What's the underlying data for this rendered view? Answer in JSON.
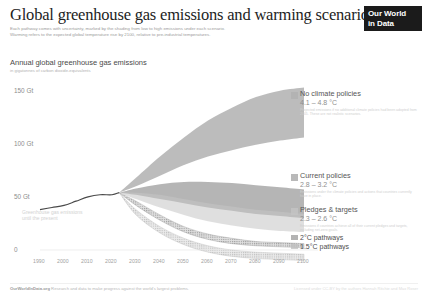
{
  "header": {
    "title": "Global greenhouse gas emissions and warming scenarios",
    "subtitle_line1": "Each pathway comes with uncertainty, marked by the shading from low to high emissions under each scenario.",
    "subtitle_line2": "Warming refers to the expected global temperature rise by 2100, relative to pre-industrial temperatures.",
    "logo_line1": "Our World",
    "logo_line2": "in Data"
  },
  "chart_heading": {
    "heading": "Annual global greenhouse gas emissions",
    "sub": "in gigatonnes of carbon dioxide-equivalents"
  },
  "historical_label": {
    "line1": "Greenhouse gas emissions",
    "line2": "until the present"
  },
  "annotations": [
    {
      "name": "No climate policies",
      "temp": "4.1 – 4.8 °C",
      "note": "Projected emissions if no additional climate policies had been adopted from 2005. These are not realistic scenarios.",
      "color": "#b0b0b0",
      "top": 90,
      "swatch_top": 92
    },
    {
      "name": "Current policies",
      "temp": "2.8 – 3.2 °C",
      "note": "Emissions under the climate policies and actions that countries currently have in place.",
      "color": "#a8a8a8",
      "top": 172,
      "swatch_top": 174
    },
    {
      "name": "Pledges & targets",
      "temp": "2.3 – 2.6 °C",
      "note": "Emissions if countries achieve all of their current pledges and targets, including net-zero goals.",
      "color": "#c4c4c4",
      "top": 206,
      "swatch_top": 208
    }
  ],
  "pathway_legend": [
    {
      "label": "2°C pathways",
      "color": "#9a9a9a"
    },
    {
      "label": "1.5°C pathways",
      "color": "#bdbdbd"
    }
  ],
  "footer": {
    "brand": "OurWorldInData.org",
    "source": "Research and data to make progress against the world's largest problems.",
    "license": "Licensed under CC-BY by the authors Hannah Ritchie and Max Roser"
  },
  "chart_data": {
    "type": "area",
    "title": "Annual global greenhouse gas emissions",
    "xlabel": "",
    "ylabel": "Gigatonnes of CO2-equivalents",
    "xlim": [
      1990,
      2100
    ],
    "ylim": [
      0,
      160
    ],
    "grid": false,
    "legend_position": "right",
    "y_ticks": [
      "0",
      "50 Gt",
      "100 Gt",
      "150 Gt"
    ],
    "y_tick_values": [
      0,
      50,
      100,
      150
    ],
    "x_ticks": [
      "1990",
      "2000",
      "2010",
      "2020",
      "2030",
      "2040",
      "2050",
      "2060",
      "2070",
      "2080",
      "2090",
      "2100"
    ],
    "x_tick_values": [
      1990,
      2000,
      2010,
      2020,
      2030,
      2040,
      2050,
      2060,
      2070,
      2080,
      2090,
      2100
    ],
    "historical": {
      "name": "Historical emissions",
      "x": [
        1990,
        1995,
        2000,
        2005,
        2010,
        2015,
        2020,
        2023
      ],
      "y": [
        38,
        40,
        42,
        46,
        50,
        52,
        52,
        54
      ]
    },
    "series": [
      {
        "name": "No climate policies",
        "temperature_range": "4.1 – 4.8 °C",
        "color": "#b0b0b0",
        "x": [
          2023,
          2030,
          2040,
          2050,
          2060,
          2070,
          2080,
          2090,
          2100
        ],
        "lower": [
          54,
          60,
          70,
          80,
          88,
          94,
          99,
          103,
          106
        ],
        "upper": [
          54,
          68,
          88,
          106,
          122,
          134,
          144,
          150,
          153
        ]
      },
      {
        "name": "Current policies",
        "temperature_range": "2.8 – 3.2 °C",
        "color": "#a8a8a8",
        "x": [
          2023,
          2030,
          2040,
          2050,
          2060,
          2070,
          2080,
          2090,
          2100
        ],
        "lower": [
          54,
          52,
          48,
          44,
          40,
          37,
          34,
          32,
          30
        ],
        "upper": [
          54,
          58,
          62,
          64,
          64,
          63,
          61,
          59,
          57
        ]
      },
      {
        "name": "Pledges & targets",
        "temperature_range": "2.3 – 2.6 °C",
        "color": "#c4c4c4",
        "x": [
          2023,
          2030,
          2040,
          2050,
          2060,
          2070,
          2080,
          2090,
          2100
        ],
        "lower": [
          54,
          48,
          40,
          33,
          27,
          23,
          20,
          18,
          17
        ],
        "upper": [
          54,
          54,
          52,
          48,
          44,
          41,
          38,
          36,
          34
        ]
      },
      {
        "name": "2°C pathways",
        "color": "#9a9a9a",
        "x": [
          2023,
          2030,
          2040,
          2050,
          2060,
          2070,
          2080,
          2090,
          2100
        ],
        "lower": [
          54,
          42,
          28,
          17,
          10,
          6,
          4,
          3,
          2
        ],
        "upper": [
          54,
          46,
          33,
          22,
          15,
          11,
          8,
          7,
          6
        ]
      },
      {
        "name": "1.5°C pathways",
        "color": "#bdbdbd",
        "x": [
          2023,
          2030,
          2040,
          2050,
          2060,
          2070,
          2080,
          2090,
          2100
        ],
        "lower": [
          54,
          33,
          16,
          5,
          -2,
          -6,
          -8,
          -9,
          -10
        ],
        "upper": [
          54,
          38,
          22,
          11,
          4,
          0,
          -2,
          -3,
          -4
        ]
      }
    ]
  }
}
